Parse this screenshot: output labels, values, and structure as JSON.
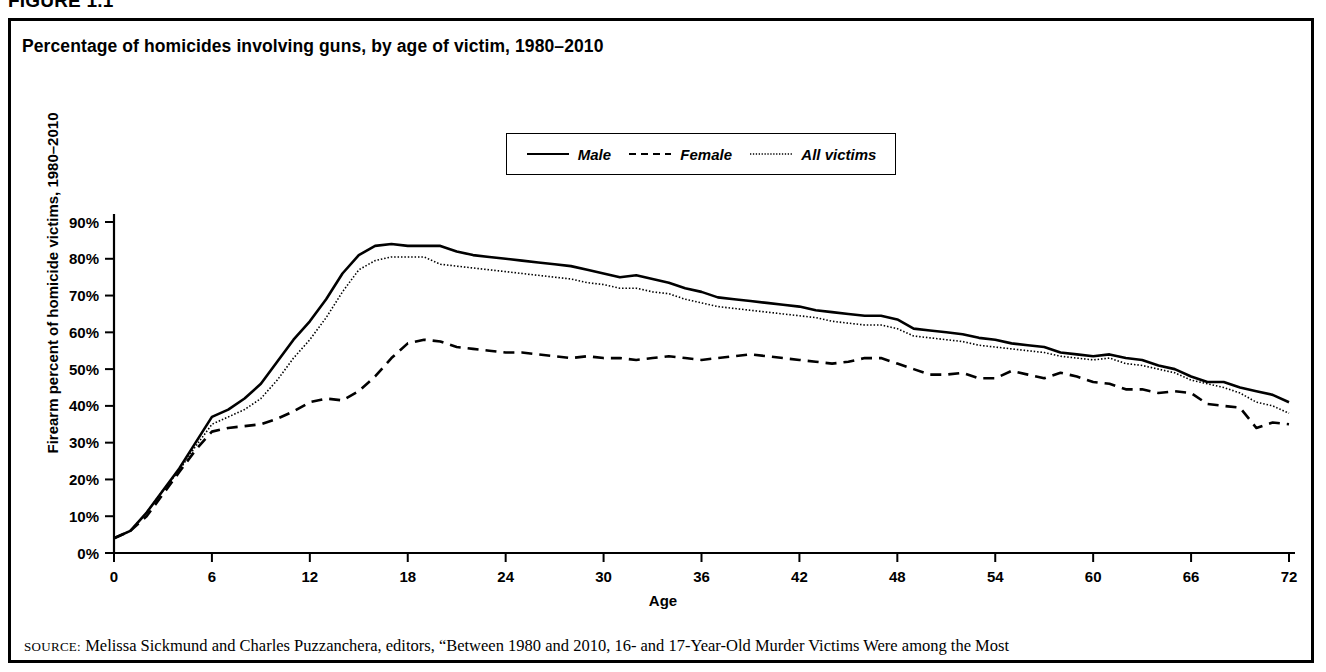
{
  "figure": {
    "label": "FIGURE 1.1",
    "title": "Percentage of homicides involving guns, by age of victim, 1980–2010"
  },
  "legend": {
    "position": "top-center",
    "items": [
      {
        "label": "Male",
        "style": "solid",
        "icon": "solid-line-icon"
      },
      {
        "label": "Female",
        "style": "dashed",
        "icon": "dashed-line-icon"
      },
      {
        "label": "All victims",
        "style": "dotted",
        "icon": "dotted-line-icon"
      }
    ]
  },
  "source": {
    "prefix": "SOURCE:",
    "text": " Melissa Sickmund and Charles Puzzanchera, editors, “Between 1980 and 2010, 16- and 17-Year-Old Murder Victims Were among the Most"
  },
  "axes": {
    "y_ticks": [
      "0%",
      "10%",
      "20%",
      "30%",
      "40%",
      "50%",
      "60%",
      "70%",
      "80%",
      "90%"
    ],
    "x_ticks": [
      "0",
      "6",
      "12",
      "18",
      "24",
      "30",
      "36",
      "42",
      "48",
      "54",
      "60",
      "66",
      "72"
    ],
    "xlabel": "Age",
    "ylabel": "Firearm percent of homicide victims, 1980–2010"
  },
  "chart_data": {
    "type": "line",
    "title": "Percentage of homicides involving guns, by age of victim, 1980–2010",
    "xlabel": "Age",
    "ylabel": "Firearm percent of homicide victims, 1980–2010",
    "xlim": [
      0,
      72
    ],
    "ylim": [
      0,
      90
    ],
    "grid": false,
    "legend_position": "top-center",
    "x": [
      0,
      1,
      2,
      3,
      4,
      5,
      6,
      7,
      8,
      9,
      10,
      11,
      12,
      13,
      14,
      15,
      16,
      17,
      18,
      19,
      20,
      21,
      22,
      23,
      24,
      25,
      26,
      27,
      28,
      29,
      30,
      31,
      32,
      33,
      34,
      35,
      36,
      37,
      38,
      39,
      40,
      41,
      42,
      43,
      44,
      45,
      46,
      47,
      48,
      49,
      50,
      51,
      52,
      53,
      54,
      55,
      56,
      57,
      58,
      59,
      60,
      61,
      62,
      63,
      64,
      65,
      66,
      67,
      68,
      69,
      70,
      71,
      72
    ],
    "series": [
      {
        "name": "Male",
        "style": "solid",
        "values": [
          4,
          6,
          11,
          17,
          23,
          30,
          37,
          39,
          42,
          46,
          52,
          58,
          63,
          69,
          76,
          81,
          83.5,
          84,
          83.5,
          83.5,
          83.5,
          82,
          81,
          80.5,
          80,
          79.5,
          79,
          78.5,
          78,
          77,
          76,
          75,
          75.5,
          74.5,
          73.5,
          72,
          71,
          69.5,
          69,
          68.5,
          68,
          67.5,
          67,
          66,
          65.5,
          65,
          64.5,
          64.5,
          63.5,
          61,
          60.5,
          60,
          59.5,
          58.5,
          58,
          57,
          56.5,
          56,
          54.5,
          54,
          53.5,
          54,
          53,
          52.5,
          51,
          50,
          48,
          46.5,
          46.5,
          45,
          44,
          43,
          41
        ]
      },
      {
        "name": "Female",
        "style": "dashed",
        "values": [
          4,
          6,
          10,
          16,
          22,
          28,
          33,
          34,
          34.5,
          35,
          36.5,
          38.5,
          41,
          42,
          41.5,
          44,
          48,
          53,
          57,
          58,
          57.5,
          56,
          55.5,
          55,
          54.5,
          54.5,
          54,
          53.5,
          53,
          53.5,
          53,
          53,
          52.5,
          53,
          53.5,
          53,
          52.5,
          53,
          53.5,
          54,
          53.5,
          53,
          52.5,
          52,
          51.5,
          52,
          53,
          53,
          51.5,
          50,
          48.5,
          48.5,
          49,
          47.5,
          47.5,
          49.5,
          48.5,
          47.5,
          49,
          48,
          46.5,
          46,
          44.5,
          44.5,
          43.5,
          44,
          43.5,
          40.5,
          40,
          39.5,
          34,
          35.5,
          35
        ]
      },
      {
        "name": "All victims",
        "style": "dotted",
        "values": [
          4,
          6,
          11,
          17,
          22.5,
          29,
          35,
          37,
          39,
          42,
          47,
          53,
          58,
          64,
          71,
          77,
          79.5,
          80.5,
          80.5,
          80.5,
          78.5,
          78,
          77.5,
          77,
          76.5,
          76,
          75.5,
          75,
          74.5,
          73.5,
          73,
          72,
          72,
          71,
          70.5,
          69,
          68,
          67,
          66.5,
          66,
          65.5,
          65,
          64.5,
          64,
          63,
          62.5,
          62,
          62,
          61,
          59,
          58.5,
          58,
          57.5,
          56.5,
          56,
          55.5,
          55,
          54.5,
          53.5,
          53,
          52.5,
          53,
          51.5,
          51,
          50,
          49,
          47,
          46,
          45,
          43.5,
          41,
          40,
          38
        ]
      }
    ]
  }
}
